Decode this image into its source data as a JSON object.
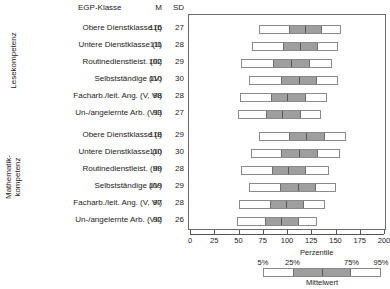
{
  "headers": {
    "egp": "EGP-Klasse",
    "m": "M",
    "sd": "SD"
  },
  "groups": [
    {
      "name": "Lesekompetenz",
      "label": "Lesekompetenz"
    },
    {
      "name": "Mathematikkompetenz",
      "label": "Mathematik-\nkompetenz"
    }
  ],
  "axis": {
    "label": "Perzentile",
    "min": 0,
    "max": 200,
    "ticks": [
      0,
      25,
      50,
      75,
      100,
      125,
      150,
      175,
      200
    ],
    "ticklabels": [
      "0",
      "25",
      "50",
      "75",
      "100",
      "125",
      "150",
      "175",
      "200"
    ]
  },
  "legend": {
    "mean_label": "Mittelwert",
    "percentile_labels": [
      "5%",
      "25%",
      "75%",
      "95%"
    ],
    "box_fill": "#9e9e9e",
    "whisker_fill": "#ffffff"
  },
  "chart_data": {
    "type": "bar",
    "title": "",
    "xlabel": "Perzentile",
    "ylabel": "",
    "xlim": [
      0,
      200
    ],
    "grid": false,
    "legend_position": "bottom-right",
    "categories": [
      "Obere Dienstklasse (I)",
      "Untere Dienstklasse (II)",
      "Routinedienstleist. (III)",
      "Selbstständige (IV)",
      "Facharb./leit. Ang. (V, VI)",
      "Un-/angelernte Arb. (VII)"
    ],
    "series": [
      {
        "name": "Lesekompetenz",
        "values": [
          {
            "category": "Obere Dienstklasse (I)",
            "M": 116,
            "SD": 27,
            "p5": 70,
            "p25": 100,
            "p75": 134,
            "p95": 155
          },
          {
            "category": "Untere Dienstklasse (II)",
            "M": 111,
            "SD": 28,
            "p5": 63,
            "p25": 94,
            "p75": 130,
            "p95": 152
          },
          {
            "category": "Routinedienstleist. (III)",
            "M": 102,
            "SD": 29,
            "p5": 52,
            "p25": 84,
            "p75": 122,
            "p95": 145
          },
          {
            "category": "Selbstständige (IV)",
            "M": 110,
            "SD": 30,
            "p5": 60,
            "p25": 92,
            "p75": 129,
            "p95": 152
          },
          {
            "category": "Facharb./leit. Ang. (V, VI)",
            "M": 98,
            "SD": 28,
            "p5": 50,
            "p25": 81,
            "p75": 118,
            "p95": 140
          },
          {
            "category": "Un-/angelernte Arb. (VII)",
            "M": 93,
            "SD": 27,
            "p5": 48,
            "p25": 76,
            "p75": 112,
            "p95": 134
          }
        ]
      },
      {
        "name": "Mathematikkompetenz",
        "values": [
          {
            "category": "Obere Dienstklasse (I)",
            "M": 118,
            "SD": 29,
            "p5": 70,
            "p25": 100,
            "p75": 137,
            "p95": 160
          },
          {
            "category": "Untere Dienstklasse (II)",
            "M": 110,
            "SD": 30,
            "p5": 62,
            "p25": 92,
            "p75": 130,
            "p95": 154
          },
          {
            "category": "Routinedienstleist. (III)",
            "M": 99,
            "SD": 28,
            "p5": 52,
            "p25": 82,
            "p75": 118,
            "p95": 142
          },
          {
            "category": "Selbstständige (IV)",
            "M": 109,
            "SD": 29,
            "p5": 60,
            "p25": 91,
            "p75": 128,
            "p95": 150
          },
          {
            "category": "Facharb./leit. Ang. (V, VI)",
            "M": 97,
            "SD": 28,
            "p5": 49,
            "p25": 80,
            "p75": 116,
            "p95": 138
          },
          {
            "category": "Un-/angelernte Arb. (VII)",
            "M": 92,
            "SD": 26,
            "p5": 47,
            "p25": 75,
            "p75": 110,
            "p95": 130
          }
        ]
      }
    ]
  }
}
